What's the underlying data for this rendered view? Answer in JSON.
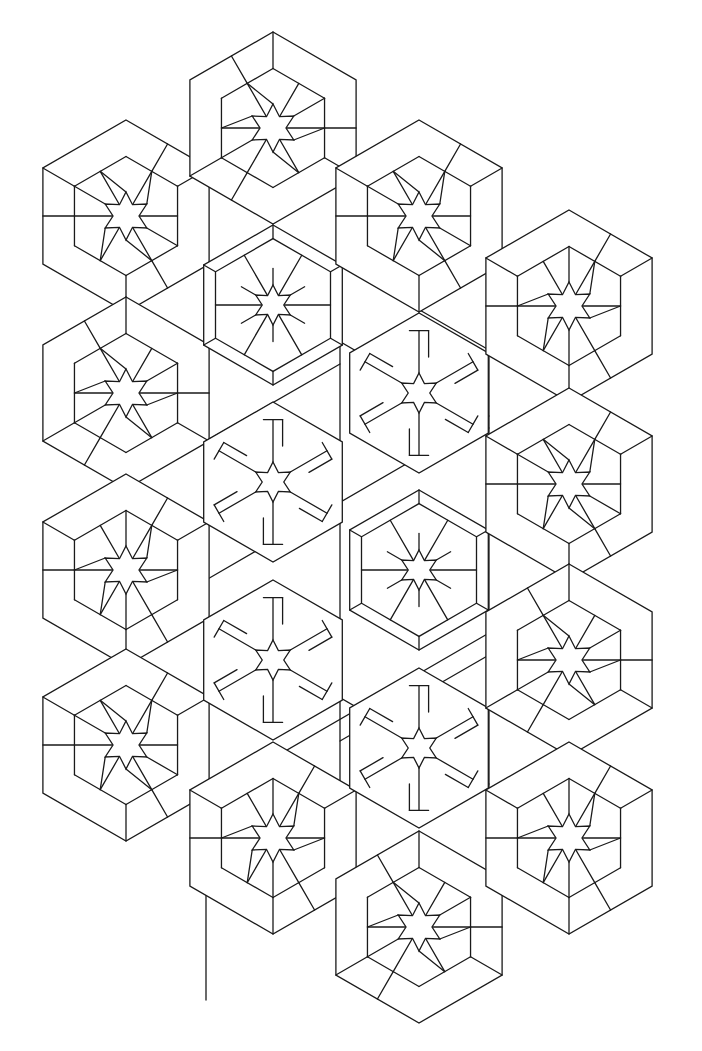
{
  "artwork": {
    "title": "Isometric hexagon star pattern",
    "stroke_color": "#1a1a1a",
    "background": "#ffffff",
    "big_radius": 96,
    "small_radius": 80,
    "star_outer": 24,
    "star_inner": 13,
    "hexagons": [
      {
        "id": "a1",
        "cx": 126,
        "cy": 216,
        "size": "big",
        "variant": 1
      },
      {
        "id": "a2",
        "cx": 126,
        "cy": 393,
        "size": "big",
        "variant": 2
      },
      {
        "id": "a3",
        "cx": 126,
        "cy": 570,
        "size": "big",
        "variant": 3
      },
      {
        "id": "a4",
        "cx": 126,
        "cy": 745,
        "size": "big",
        "variant": 1
      },
      {
        "id": "b1",
        "cx": 273,
        "cy": 128,
        "size": "big",
        "variant": 2
      },
      {
        "id": "b2",
        "cx": 273,
        "cy": 305,
        "size": "small",
        "variant": 4
      },
      {
        "id": "b3",
        "cx": 273,
        "cy": 482,
        "size": "small",
        "variant": 5
      },
      {
        "id": "b4",
        "cx": 273,
        "cy": 660,
        "size": "small",
        "variant": 5
      },
      {
        "id": "b5",
        "cx": 273,
        "cy": 838,
        "size": "big",
        "variant": 3
      },
      {
        "id": "c1",
        "cx": 419,
        "cy": 216,
        "size": "big",
        "variant": 1
      },
      {
        "id": "c2",
        "cx": 419,
        "cy": 393,
        "size": "small",
        "variant": 5
      },
      {
        "id": "c3",
        "cx": 419,
        "cy": 570,
        "size": "small",
        "variant": 4
      },
      {
        "id": "c4",
        "cx": 419,
        "cy": 748,
        "size": "small",
        "variant": 5
      },
      {
        "id": "c5",
        "cx": 419,
        "cy": 927,
        "size": "big",
        "variant": 2
      },
      {
        "id": "d1",
        "cx": 569,
        "cy": 306,
        "size": "big",
        "variant": 3
      },
      {
        "id": "d2",
        "cx": 569,
        "cy": 484,
        "size": "big",
        "variant": 1
      },
      {
        "id": "d3",
        "cx": 569,
        "cy": 660,
        "size": "big",
        "variant": 2
      },
      {
        "id": "d4",
        "cx": 569,
        "cy": 838,
        "size": "big",
        "variant": 3
      }
    ],
    "lattice_lines": [
      [
        206,
        224,
        206,
        1000
      ],
      [
        340,
        224,
        340,
        934
      ],
      [
        489,
        300,
        489,
        900
      ],
      [
        206,
        264,
        489,
        428
      ],
      [
        206,
        441,
        340,
        364
      ],
      [
        340,
        264,
        489,
        350
      ],
      [
        206,
        580,
        489,
        416
      ],
      [
        206,
        620,
        489,
        784
      ],
      [
        206,
        797,
        489,
        633
      ],
      [
        340,
        741,
        489,
        655
      ]
    ]
  }
}
